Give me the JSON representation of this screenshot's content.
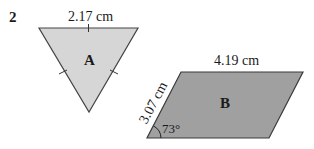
{
  "question_number": "2",
  "shapes": {
    "triangle": {
      "label": "A",
      "side_label": "2.17 cm",
      "fill": "#d6d6d6",
      "stroke": "#444444",
      "description": "equilateral triangle (tick marks on all three sides)"
    },
    "parallelogram": {
      "label": "B",
      "top_label": "4.19 cm",
      "side_label": "3.07 cm",
      "angle_label": "73°",
      "fill": "#a0a0a0",
      "stroke": "#3a3a3a"
    }
  }
}
